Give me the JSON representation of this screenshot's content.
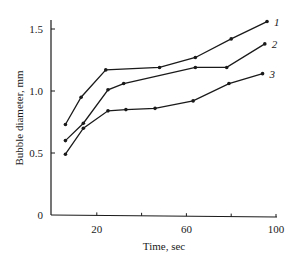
{
  "chart_data": {
    "type": "line",
    "title": "",
    "xlabel": "Time, sec",
    "ylabel": "Bubble diameter, mm",
    "xlim": [
      0,
      100
    ],
    "ylim": [
      0,
      1.7
    ],
    "x_ticks": [
      20,
      40,
      60,
      80,
      100
    ],
    "x_tick_labels": [
      "20",
      "",
      "60",
      "",
      "100"
    ],
    "y_ticks": [
      0,
      0.5,
      1.0,
      1.5
    ],
    "y_tick_labels": [
      "0",
      "0.5",
      "1.0",
      "1.5"
    ],
    "grid": false,
    "legend": "inline labels at line ends",
    "series": [
      {
        "name": "1",
        "x": [
          6,
          13,
          24,
          48,
          64,
          80,
          96
        ],
        "y": [
          0.73,
          0.95,
          1.17,
          1.19,
          1.27,
          1.42,
          1.56
        ]
      },
      {
        "name": "2",
        "x": [
          6,
          14,
          25,
          32,
          64,
          78,
          95
        ],
        "y": [
          0.6,
          0.74,
          1.01,
          1.06,
          1.19,
          1.19,
          1.38
        ]
      },
      {
        "name": "3",
        "x": [
          6,
          14,
          25,
          33,
          46,
          63,
          79,
          94
        ],
        "y": [
          0.49,
          0.7,
          0.84,
          0.85,
          0.86,
          0.92,
          1.06,
          1.14
        ]
      }
    ]
  },
  "colors": {
    "ink": "#1a1a1a",
    "background": "#ffffff"
  }
}
